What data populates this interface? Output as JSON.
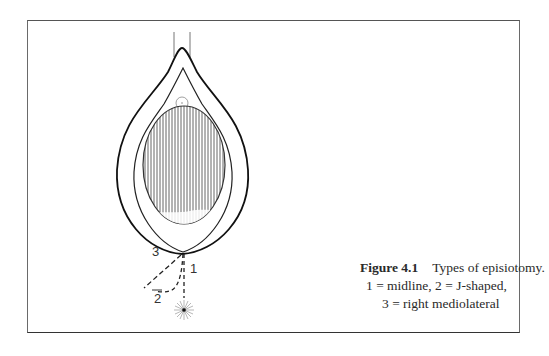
{
  "figure": {
    "caption": {
      "label": "Figure 4.1",
      "title": "Types of episiotomy.",
      "line2": "1 = midline, 2 = J-shaped,",
      "line3": "3 = right mediolateral"
    },
    "incision_labels": {
      "midline": "1",
      "j_shaped": "2",
      "right_mediolateral": "3"
    }
  }
}
